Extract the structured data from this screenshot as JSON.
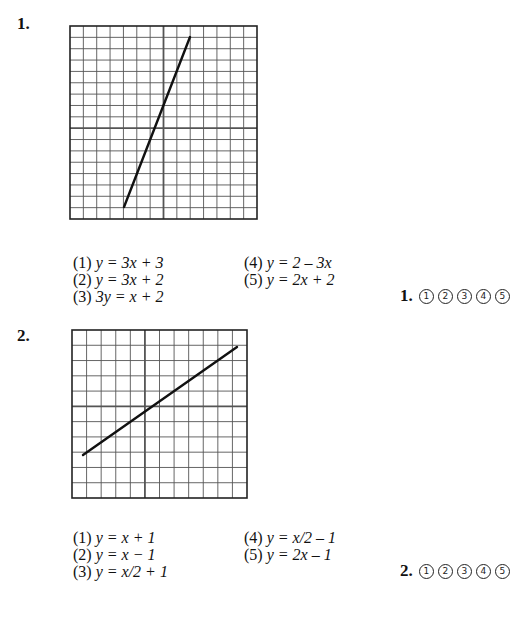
{
  "questions": [
    {
      "number": "1.",
      "graph": {
        "left": 70,
        "top": 26,
        "width": 187,
        "height": 193,
        "cols": 14,
        "rows": 17,
        "y_axis_col": 7,
        "x_axis_row": 9,
        "line": {
          "x1": 124,
          "y1": 207,
          "x2": 190,
          "y2": 37
        }
      },
      "choices": [
        {
          "label": "(1)",
          "equation": "y = 3x + 3"
        },
        {
          "label": "(2)",
          "equation": "y = 3x + 2"
        },
        {
          "label": "(3)",
          "equation": "3y = x + 2"
        },
        {
          "label": "(4)",
          "equation": "y = 2 – 3x"
        },
        {
          "label": "(5)",
          "equation": "y = 2x + 2"
        }
      ],
      "answer_label": "1.",
      "bubbles": [
        "1",
        "2",
        "3",
        "4",
        "5"
      ]
    },
    {
      "number": "2.",
      "graph": {
        "left": 72,
        "top": 330,
        "width": 175,
        "height": 168,
        "cols": 12,
        "rows": 11,
        "y_axis_col": 5,
        "x_axis_row": 5,
        "line": {
          "x1": 83,
          "y1": 455,
          "x2": 237,
          "y2": 347
        }
      },
      "choices": [
        {
          "label": "(1)",
          "equation": "y = x + 1"
        },
        {
          "label": "(2)",
          "equation": "y = x − 1"
        },
        {
          "label": "(3)",
          "equation": "y = x/2 + 1"
        },
        {
          "label": "(4)",
          "equation": "y = x/2 – 1"
        },
        {
          "label": "(5)",
          "equation": "y = 2x – 1"
        }
      ],
      "answer_label": "2.",
      "bubbles": [
        "1",
        "2",
        "3",
        "4",
        "5"
      ]
    }
  ]
}
